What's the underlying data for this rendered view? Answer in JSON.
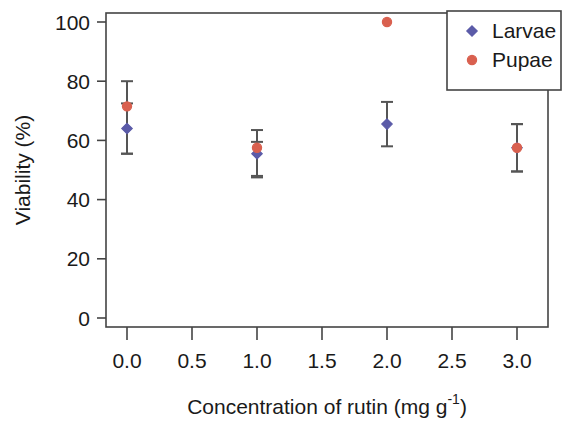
{
  "chart_data": {
    "type": "scatter",
    "title": "",
    "xlabel": "Concentration of rutin (mg g",
    "xlabel_sup": "-1",
    "xlabel_tail": ")",
    "ylabel": "Viability (%)",
    "xlim": [
      -0.15,
      3.15
    ],
    "ylim": [
      -6,
      106
    ],
    "grid": false,
    "legend_position": "top-right",
    "x_ticks": [
      "0.0",
      "0.5",
      "1.0",
      "1.5",
      "2.0",
      "2.5",
      "3.0"
    ],
    "x_tick_values": [
      0.0,
      0.5,
      1.0,
      1.5,
      2.0,
      2.5,
      3.0
    ],
    "y_ticks": [
      "0",
      "20",
      "40",
      "60",
      "80",
      "100"
    ],
    "y_tick_values": [
      0,
      20,
      40,
      60,
      80,
      100
    ],
    "x": [
      0.0,
      1.0,
      2.0,
      3.0
    ],
    "series": [
      {
        "name": "Larvae",
        "color": "#5b5ba8",
        "marker": "diamond",
        "values": [
          64,
          55.5,
          65.5,
          57.5
        ],
        "err_low": [
          55.5,
          48,
          58,
          49.5
        ],
        "err_high": [
          72.5,
          59.5,
          73,
          65.5
        ]
      },
      {
        "name": "Pupae",
        "color": "#d9604f",
        "marker": "circle",
        "values": [
          71.5,
          57.5,
          100,
          57.5
        ],
        "err_low": [
          55.5,
          47.5,
          null,
          49.5
        ],
        "err_high": [
          80,
          63.5,
          null,
          65.5
        ]
      }
    ]
  },
  "legend": {
    "entries": [
      {
        "label": "Larvae",
        "color": "#5b5ba8",
        "marker": "diamond"
      },
      {
        "label": "Pupae",
        "color": "#d9604f",
        "marker": "circle"
      }
    ]
  }
}
